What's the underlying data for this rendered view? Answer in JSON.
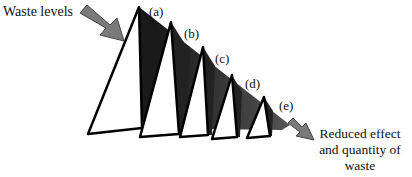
{
  "diagram": {
    "input_label": "Waste levels",
    "output_label_lines": [
      "Reduced effect",
      "and quantity of",
      "waste"
    ],
    "levels": [
      {
        "tag": "(a)"
      },
      {
        "tag": "(b)"
      },
      {
        "tag": "(c)"
      },
      {
        "tag": "(d)"
      },
      {
        "tag": "(e)"
      }
    ],
    "colors": {
      "background": "#ffffff",
      "triangle_fill": "#ffffff",
      "outline": "#000000",
      "shadow_dark": "#1a1a1a",
      "shadow_mid": "#555555",
      "arrow_fill": "#7a7a7a"
    }
  }
}
